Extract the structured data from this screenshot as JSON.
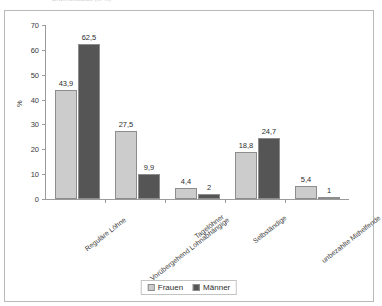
{
  "top_caption": "Erwerbsstatus (in %)",
  "legend": {
    "position": "bottom-center",
    "items": [
      {
        "label": "Frauen",
        "color": "#cccccc"
      },
      {
        "label": "Männer",
        "color": "#555555"
      }
    ]
  },
  "colors": {
    "frauen": "#cccccc",
    "maenner": "#555555",
    "axis": "#9b9b9b",
    "bar_border": "#8d8d8d",
    "frame": "#b9b9b9",
    "text": "#333333"
  },
  "chart_data": {
    "type": "bar",
    "title": "",
    "xlabel": "",
    "ylabel": "%",
    "ylim": [
      0,
      70
    ],
    "yticks": [
      0,
      10,
      20,
      30,
      40,
      50,
      60,
      70
    ],
    "ytick_labels": [
      "0",
      "10",
      "20",
      "30",
      "40",
      "50",
      "60",
      "70"
    ],
    "grid": false,
    "legend_position": "bottom",
    "categories": [
      "Reguläre Löhne",
      "Vorübergehend Lohnabhängige",
      "Tagelöhner",
      "Selbständige",
      "unbezahlte Mithelfende"
    ],
    "series": [
      {
        "name": "Frauen",
        "color": "#cccccc",
        "values": [
          43.9,
          27.5,
          4.4,
          18.8,
          5.4
        ],
        "value_labels": [
          "43,9",
          "27,5",
          "4,4",
          "18,8",
          "5,4"
        ]
      },
      {
        "name": "Männer",
        "color": "#555555",
        "values": [
          62.5,
          9.9,
          2.0,
          24.7,
          1.0
        ],
        "value_labels": [
          "62,5",
          "9,9",
          "2",
          "24,7",
          "1"
        ]
      }
    ]
  }
}
